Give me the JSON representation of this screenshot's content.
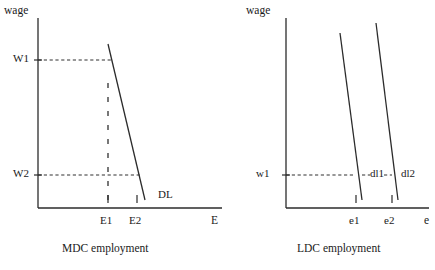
{
  "figure": {
    "panels": [
      {
        "id": "mdc",
        "caption": "MDC employment",
        "y_axis_label": "wage",
        "x_axis_label": "E",
        "wage_ticks": [
          {
            "label": "W1"
          },
          {
            "label": "W2"
          }
        ],
        "employment_ticks": [
          {
            "label": "E1"
          },
          {
            "label": "E2"
          }
        ],
        "curves": [
          {
            "label": "DL"
          }
        ]
      },
      {
        "id": "ldc",
        "caption": "LDC employment",
        "y_axis_label": "wage",
        "x_axis_label": "e",
        "wage_ticks": [
          {
            "label": "w1"
          }
        ],
        "employment_ticks": [
          {
            "label": "e1"
          },
          {
            "label": "e2"
          }
        ],
        "curves": [
          {
            "label": "dl1"
          },
          {
            "label": "dl2"
          }
        ]
      }
    ],
    "colors": {
      "ink": "#2b2b2b",
      "background": "#ffffff"
    }
  }
}
